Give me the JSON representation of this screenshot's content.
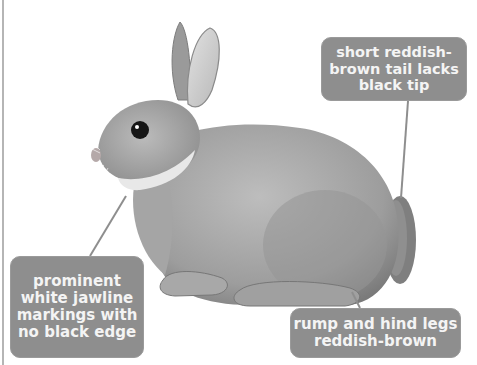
{
  "image": {
    "subject": "Rabbit illustration (greyscale) with annotation callouts",
    "background": "#ffffff",
    "callout_color": "#8e8e8e",
    "callout_text_color": "#f4f4f4"
  },
  "callouts": [
    {
      "id": "tail",
      "text": "short reddish-\nbrown tail lacks\nblack tip"
    },
    {
      "id": "jaw",
      "text": "prominent\nwhite jawline\nmarkings with\nno black edge"
    },
    {
      "id": "rump",
      "text": "rump and hind legs\nreddish-brown"
    }
  ]
}
